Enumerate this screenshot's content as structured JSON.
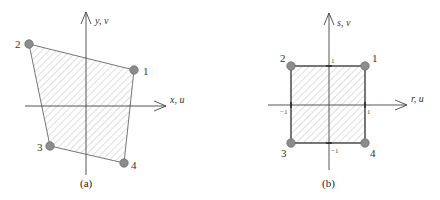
{
  "panels": [
    {
      "id": "a",
      "caption": "(a)",
      "axis_x_label": "x, u",
      "axis_y_label": "y, v",
      "nodes": [
        {
          "label": "1",
          "x": 134,
          "y": 70
        },
        {
          "label": "2",
          "x": 29,
          "y": 44
        },
        {
          "label": "3",
          "x": 50,
          "y": 146
        },
        {
          "label": "4",
          "x": 124,
          "y": 163
        }
      ],
      "description": "Arbitrary quadrilateral element in global x-y coordinates"
    },
    {
      "id": "b",
      "caption": "(b)",
      "axis_x_label": "r, u",
      "axis_y_label": "s, v",
      "nodes": [
        {
          "label": "1",
          "x": 365,
          "y": 66
        },
        {
          "label": "2",
          "x": 291,
          "y": 66
        },
        {
          "label": "3",
          "x": 291,
          "y": 143
        },
        {
          "label": "4",
          "x": 365,
          "y": 143
        }
      ],
      "ticks": {
        "top": "1",
        "bottom": "−1",
        "left": "−1",
        "right": "1"
      },
      "description": "Square parent element in natural r-s coordinates"
    }
  ],
  "colors": {
    "node_fill": "#8c8c8c",
    "node_stroke": "#6e6e6e",
    "edge": "#555555",
    "hatch": "#c8c8c8",
    "axis": "#444444"
  }
}
